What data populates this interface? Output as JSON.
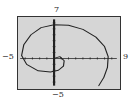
{
  "chart_data": {
    "type": "line",
    "title": "",
    "xlabel": "",
    "ylabel": "",
    "xlim": [
      -5,
      9
    ],
    "ylim": [
      -5,
      7
    ],
    "grid": false,
    "legend": null,
    "tick_labels": {
      "x_min": "−5",
      "x_max": "9",
      "y_min": "−5",
      "y_max": "7"
    },
    "series": [
      {
        "name": "spiral",
        "x": [
          0,
          0.8,
          1.4,
          1.3,
          0.6,
          -0.5,
          -2.2,
          -3.8,
          -4.5,
          -4.2,
          -3.2,
          -1.8,
          0,
          2.0,
          4.0,
          5.8,
          7.0,
          7.5,
          7.4,
          6.9,
          6.2
        ],
        "y": [
          0,
          0.3,
          -0.4,
          -1.3,
          -2.0,
          -2.3,
          -2.1,
          -1.0,
          0.5,
          2.3,
          4.0,
          5.2,
          5.7,
          5.6,
          4.9,
          3.6,
          2.0,
          0.3,
          -1.5,
          -3.2,
          -4.6
        ]
      }
    ],
    "colors": {
      "background": "#d6d6d6",
      "curve": "#222222",
      "axes": "#222222",
      "frame": "#333333"
    }
  }
}
